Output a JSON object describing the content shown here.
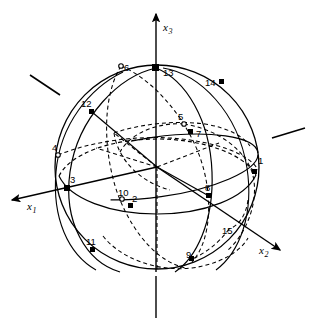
{
  "figure": {
    "background_color": "#ffffff",
    "stroke_color": "#000000",
    "width": 310,
    "height": 328,
    "sphere": {
      "center_x": 157,
      "center_y": 167,
      "radius": 102
    }
  },
  "axes": [
    {
      "name": "x1",
      "label": "x",
      "subscript": "1",
      "label_x": 27,
      "label_y": 210,
      "tip_x": 6,
      "tip_y": 201,
      "tail_x": 157,
      "tail_y": 167
    },
    {
      "name": "x2",
      "label": "x",
      "subscript": "2",
      "label_x": 259,
      "label_y": 254,
      "tip_x": 285,
      "tip_y": 253,
      "tail_x": 157,
      "tail_y": 167
    },
    {
      "name": "x3",
      "label": "x",
      "subscript": "3",
      "label_x": 163,
      "label_y": 31,
      "tip_x": 156,
      "tip_y": 10,
      "tail_x": 156,
      "tail_y": 318
    }
  ],
  "points": [
    {
      "id": "1",
      "label": "1",
      "x": 255,
      "y": 172,
      "marker": "filled",
      "label_x": 258,
      "label_y": 164
    },
    {
      "id": "2",
      "label": "2",
      "x": 131,
      "y": 206,
      "marker": "filled",
      "label_x": 132,
      "label_y": 202
    },
    {
      "id": "3",
      "label": "3",
      "x": 67,
      "y": 188,
      "marker": "filled",
      "label_x": 70,
      "label_y": 183
    },
    {
      "id": "4",
      "label": "4",
      "x": 58,
      "y": 155,
      "marker": "open",
      "label_x": 55,
      "label_y": 151
    },
    {
      "id": "5",
      "label": "5",
      "x": 184,
      "y": 124,
      "marker": "open",
      "label_x": 178,
      "label_y": 120
    },
    {
      "id": "6",
      "label": "6",
      "x": 121,
      "y": 66,
      "marker": "open",
      "label_x": 124,
      "label_y": 70
    },
    {
      "id": "7",
      "label": "7",
      "x": 191,
      "y": 132,
      "marker": "filled",
      "label_x": 196,
      "label_y": 135
    },
    {
      "id": "8",
      "label": "8",
      "x": 209,
      "y": 196,
      "marker": "filled",
      "label_x": 207,
      "label_y": 192
    },
    {
      "id": "9",
      "label": "9",
      "x": 192,
      "y": 259,
      "marker": "filled",
      "label_x": 188,
      "label_y": 257
    },
    {
      "id": "10",
      "label": "10",
      "x": 122,
      "y": 199,
      "marker": "open",
      "label_x": 119,
      "label_y": 194
    },
    {
      "id": "11",
      "label": "11",
      "x": 93,
      "y": 250,
      "marker": "filled",
      "label_x": 89,
      "label_y": 245
    },
    {
      "id": "12",
      "label": "12",
      "x": 92,
      "y": 112,
      "marker": "filled",
      "label_x": 84,
      "label_y": 107
    },
    {
      "id": "13",
      "label": "13",
      "x": 156,
      "y": 68,
      "marker": "filled",
      "label_x": 163,
      "label_y": 76
    },
    {
      "id": "14",
      "label": "14",
      "x": 222,
      "y": 82,
      "marker": "filled",
      "label_x": 208,
      "label_y": 86
    },
    {
      "id": "15",
      "label": "15",
      "x": 229,
      "y": 229,
      "marker": "none",
      "label_x": 224,
      "label_y": 234
    }
  ],
  "tick_marks": [
    {
      "name": "upper-left-tick",
      "x1": 30,
      "y1": 75,
      "x2": 60,
      "y2": 95
    },
    {
      "name": "right-tick",
      "x1": 272,
      "y1": 138,
      "x2": 305,
      "y2": 128
    }
  ],
  "curves": {
    "outline_style": "solid",
    "hidden_style": "dashed",
    "dash_pattern": "4,3"
  }
}
